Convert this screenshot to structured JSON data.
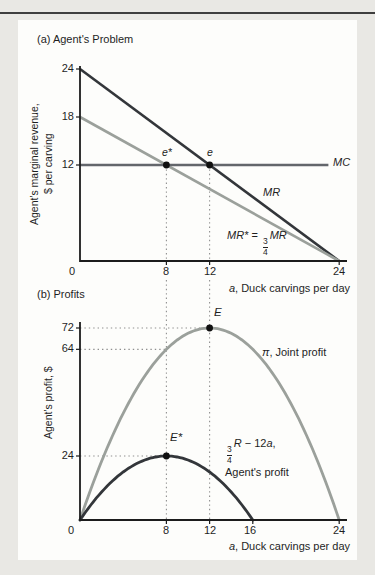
{
  "figure": {
    "panel_a": {
      "title": "(a) Agent's Problem",
      "ylabel_line1": "Agent's marginal revenue,",
      "ylabel_line2": "$ per carving",
      "yticks": [
        "24",
        "18",
        "12"
      ],
      "xticks": [
        "0",
        "8",
        "12",
        "24"
      ],
      "xlabel_var": "a",
      "xlabel_text": ", Duck carvings per day",
      "mc_label": "MC",
      "mr_label": "MR",
      "mrstar_lhs": "MR*",
      "mrstar_eq": " = ",
      "mrstar_frac_num": "3",
      "mrstar_frac_den": "4",
      "mrstar_rhs": "MR",
      "point_estar": "e*",
      "point_e": "e"
    },
    "panel_b": {
      "title": "(b) Profits",
      "ylabel": "Agent's profit, $",
      "yticks": [
        "72",
        "64",
        "24"
      ],
      "xticks": [
        "0",
        "8",
        "12",
        "16",
        "24"
      ],
      "xlabel_var": "a",
      "xlabel_text": ", Duck carvings per day",
      "pi_symbol": "π",
      "pi_rest": ", Joint profit",
      "agent_frac_num": "3",
      "agent_frac_den": "4",
      "agent_r": "R",
      "agent_mid": " − 12",
      "agent_var": "a",
      "agent_comma": ",",
      "agent_line2": "Agent's profit",
      "point_E": "E",
      "point_Estar": "E*"
    }
  },
  "colors": {
    "dark_line": "#33363a",
    "gray_line": "#9ba09b",
    "mc_line": "#63666b",
    "axis": "#1c1c1c",
    "guide": "#8f8f8f",
    "point": "#101010",
    "background": "#e9e8e4",
    "panel": "#fdfdfb"
  },
  "chart_data": [
    {
      "type": "line",
      "panel": "a",
      "title": "(a) Agent's Problem",
      "xlabel": "a, Duck carvings per day",
      "ylabel": "Agent's marginal revenue, $ per carving",
      "xlim": [
        0,
        24
      ],
      "ylim": [
        0,
        24
      ],
      "xticks": [
        0,
        8,
        12,
        24
      ],
      "yticks": [
        24,
        18,
        12
      ],
      "grid": false,
      "series": [
        {
          "name": "MR",
          "kind": "segment",
          "points": [
            [
              0,
              24
            ],
            [
              24,
              0
            ]
          ],
          "color": "#33363a"
        },
        {
          "name": "MR* = (3/4)MR",
          "kind": "segment",
          "points": [
            [
              0,
              18
            ],
            [
              24,
              0
            ]
          ],
          "color": "#9ba09b"
        },
        {
          "name": "MC",
          "kind": "segment",
          "points": [
            [
              0,
              12
            ],
            [
              23,
              12
            ]
          ],
          "color": "#63666b"
        }
      ],
      "points": [
        {
          "label": "e*",
          "x": 8,
          "y": 12
        },
        {
          "label": "e",
          "x": 12,
          "y": 12
        }
      ],
      "guide_vlines": [
        8,
        12
      ]
    },
    {
      "type": "line",
      "panel": "b",
      "title": "(b) Profits",
      "xlabel": "a, Duck carvings per day",
      "ylabel": "Agent's profit, $",
      "xlim": [
        0,
        24
      ],
      "ylim": [
        0,
        80
      ],
      "xticks": [
        0,
        8,
        12,
        16,
        24
      ],
      "yticks": [
        72,
        64,
        24
      ],
      "grid": false,
      "series": [
        {
          "name": "π, Joint profit",
          "kind": "quad",
          "zeros": [
            0,
            24
          ],
          "peak": [
            12,
            72
          ],
          "color": "#9ba09b"
        },
        {
          "name": "(3/4)R − 12a, Agent's profit",
          "kind": "quad",
          "zeros": [
            0,
            16
          ],
          "peak": [
            8,
            24
          ],
          "color": "#33363a"
        }
      ],
      "points": [
        {
          "label": "E",
          "x": 12,
          "y": 72
        },
        {
          "label": "E*",
          "x": 8,
          "y": 24
        }
      ],
      "guide_vlines": [
        8,
        12
      ],
      "guide_hlines": [
        {
          "y": 72,
          "to_x": 12
        },
        {
          "y": 64,
          "to_x": 8
        },
        {
          "y": 24,
          "to_x": 8
        }
      ]
    }
  ]
}
